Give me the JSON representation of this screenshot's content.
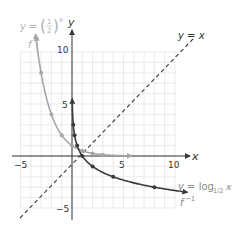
{
  "chart_data": {
    "type": "line",
    "title": "",
    "xlabel": "x",
    "ylabel": "y",
    "xlim": [
      -5,
      10
    ],
    "ylim": [
      -5,
      10
    ],
    "grid": true,
    "x_tick_labels": [
      "-5",
      "5",
      "10"
    ],
    "y_tick_labels": [
      "10",
      "5",
      "-5"
    ],
    "series": [
      {
        "name": "y = (1/2)^x",
        "label": "f",
        "color": "#a6a6a6",
        "points": [
          [
            -3,
            8
          ],
          [
            -2,
            4
          ],
          [
            -1,
            2
          ],
          [
            0,
            1
          ],
          [
            1,
            0.5
          ],
          [
            2,
            0.25
          ],
          [
            3,
            0.125
          ]
        ]
      },
      {
        "name": "y = log_{1/2} x",
        "label": "f^-1",
        "color": "#4a4a4a",
        "points": [
          [
            0.125,
            3
          ],
          [
            0.25,
            2
          ],
          [
            0.5,
            1
          ],
          [
            1,
            0
          ],
          [
            2,
            -1
          ],
          [
            4,
            -2
          ],
          [
            8,
            -3
          ]
        ]
      },
      {
        "name": "y = x",
        "style": "dashed",
        "color": "#4a4a4a",
        "points": [
          [
            -5,
            -5
          ],
          [
            10,
            10
          ]
        ]
      }
    ],
    "annotations": [
      {
        "text": "y = (1/2)^x",
        "at": "top-left"
      },
      {
        "text": "f",
        "at": "top-left arrow"
      },
      {
        "text": "y = x",
        "at": "top-right"
      },
      {
        "text": "y = log1/2 x",
        "at": "right"
      },
      {
        "text": "f^-1",
        "at": "bottom-right"
      }
    ]
  },
  "labels": {
    "axis_x": "x",
    "axis_y": "y",
    "tick_x_neg5": "−5",
    "tick_x_5": "5",
    "tick_x_10": "10",
    "tick_y_10": "10",
    "tick_y_5": "5",
    "tick_y_neg5": "−5",
    "exp_eq_prefix": "y = ",
    "exp_frac_num": "1",
    "exp_frac_den": "2",
    "exp_power": "x",
    "exp_name": "f",
    "identity_eq": "y = x",
    "log_eq_prefix": "y = log",
    "log_base": "1/2",
    "log_arg": " x",
    "log_name": "f",
    "log_name_sup": "−1"
  }
}
